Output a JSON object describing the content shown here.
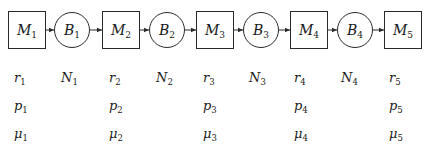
{
  "diagram": {
    "type": "serial production line",
    "nodes": [
      {
        "id": "M1",
        "kind": "machine",
        "base": "M",
        "sub": "1"
      },
      {
        "id": "B1",
        "kind": "buffer",
        "base": "B",
        "sub": "1"
      },
      {
        "id": "M2",
        "kind": "machine",
        "base": "M",
        "sub": "2"
      },
      {
        "id": "B2",
        "kind": "buffer",
        "base": "B",
        "sub": "2"
      },
      {
        "id": "M3",
        "kind": "machine",
        "base": "M",
        "sub": "3"
      },
      {
        "id": "B3",
        "kind": "buffer",
        "base": "B",
        "sub": "3"
      },
      {
        "id": "M4",
        "kind": "machine",
        "base": "M",
        "sub": "4"
      },
      {
        "id": "B4",
        "kind": "buffer",
        "base": "B",
        "sub": "4"
      },
      {
        "id": "M5",
        "kind": "machine",
        "base": "M",
        "sub": "5"
      }
    ],
    "edges": [
      {
        "from": "M1",
        "to": "B1"
      },
      {
        "from": "B1",
        "to": "M2"
      },
      {
        "from": "M2",
        "to": "B2"
      },
      {
        "from": "B2",
        "to": "M3"
      },
      {
        "from": "M3",
        "to": "B3"
      },
      {
        "from": "B3",
        "to": "M4"
      },
      {
        "from": "M4",
        "to": "B4"
      },
      {
        "from": "B4",
        "to": "M5"
      }
    ],
    "parameter_rows": [
      {
        "row": "r",
        "cells": [
          {
            "base": "r",
            "sub": "1"
          },
          {
            "base": "N",
            "sub": "1"
          },
          {
            "base": "r",
            "sub": "2"
          },
          {
            "base": "N",
            "sub": "2"
          },
          {
            "base": "r",
            "sub": "3"
          },
          {
            "base": "N",
            "sub": "3"
          },
          {
            "base": "r",
            "sub": "4"
          },
          {
            "base": "N",
            "sub": "4"
          },
          {
            "base": "r",
            "sub": "5"
          }
        ]
      },
      {
        "row": "p",
        "cells": [
          {
            "base": "p",
            "sub": "1"
          },
          null,
          {
            "base": "p",
            "sub": "2"
          },
          null,
          {
            "base": "p",
            "sub": "3"
          },
          null,
          {
            "base": "p",
            "sub": "4"
          },
          null,
          {
            "base": "p",
            "sub": "5"
          }
        ]
      },
      {
        "row": "mu",
        "cells": [
          {
            "base": "μ",
            "sub": "1"
          },
          null,
          {
            "base": "μ",
            "sub": "2"
          },
          null,
          {
            "base": "μ",
            "sub": "3"
          },
          null,
          {
            "base": "μ",
            "sub": "4"
          },
          null,
          {
            "base": "μ",
            "sub": "5"
          }
        ]
      }
    ],
    "colors": {
      "stroke": "#2a2a2a",
      "text": "#1a1a1a",
      "background": "#ffffff"
    }
  }
}
